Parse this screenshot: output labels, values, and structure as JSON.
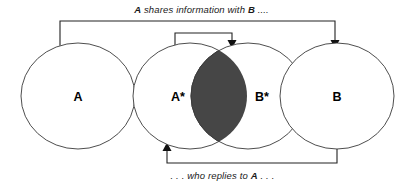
{
  "diagram": {
    "title_top": {
      "prefix": "",
      "em1": "A",
      "middle": " shares information with ",
      "em2": "B",
      "suffix": " ...."
    },
    "title_bottom": {
      "prefix": ". . . who replies to ",
      "em1": "A",
      "suffix": " . . ."
    },
    "sets": [
      {
        "label": "A",
        "name": "circle-a"
      },
      {
        "label": "A*",
        "name": "circle-a-star"
      },
      {
        "label": "B*",
        "name": "circle-b-star"
      },
      {
        "label": "B",
        "name": "circle-b"
      }
    ],
    "colors": {
      "intersection_fill": "#464646",
      "circle_stroke": "#3a3a3a",
      "connector_stroke": "#222222",
      "background": "#ffffff",
      "text": "#1a1a1a"
    },
    "connectors": [
      {
        "name": "connector-a-to-b",
        "from": "A",
        "to": "B"
      },
      {
        "name": "connector-astar-to-bstar",
        "from": "A*",
        "to": "B*"
      },
      {
        "name": "connector-b-to-astar",
        "from": "B",
        "to": "A*"
      }
    ]
  }
}
